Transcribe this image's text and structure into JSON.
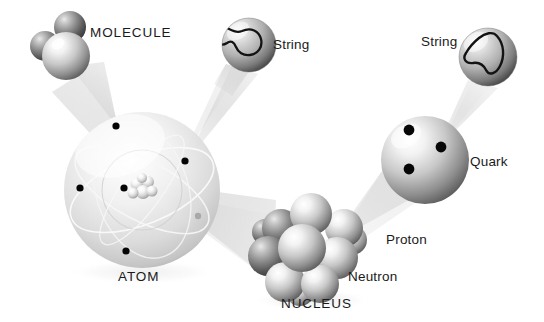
{
  "figure": {
    "background_color": "#ffffff",
    "width": 544,
    "height": 322
  },
  "labels": {
    "molecule": "MOLECULE",
    "string_1": "String",
    "string_2": "String",
    "quark": "Quark",
    "proton": "Proton",
    "neutron": "Neutron",
    "atom": "ATOM",
    "nucleus": "NUCLEUS"
  },
  "colors": {
    "text": "#1a1a1a",
    "sphere_light": "#ffffff",
    "sphere_mid": "#c9c9c9",
    "sphere_dark": "#4a4a4a",
    "sphere_edge": "#6e6e6e",
    "electron": "#050505",
    "cone": "#d8d8d8",
    "atom_shell": "#d0d0d0",
    "orbit_line": "#f2f2f2",
    "string_outline": "#111111"
  },
  "objects": {
    "molecule": {
      "name": "MOLECULE",
      "atom_count": 3,
      "atoms": [
        {
          "cx": 45,
          "cy": 46,
          "r": 15
        },
        {
          "cx": 70,
          "cy": 27,
          "r": 16
        },
        {
          "cx": 66,
          "cy": 56,
          "r": 24
        }
      ]
    },
    "atom": {
      "name": "ATOM",
      "cx": 142,
      "cy": 190,
      "r": 78,
      "electron_count": 6,
      "electrons": [
        {
          "cx": 116,
          "cy": 126
        },
        {
          "cx": 185,
          "cy": 161
        },
        {
          "cx": 80,
          "cy": 188
        },
        {
          "cx": 124,
          "cy": 188
        },
        {
          "cx": 198,
          "cy": 216
        },
        {
          "cx": 126,
          "cy": 251
        }
      ],
      "nucleus_center": {
        "cx": 143,
        "cy": 187,
        "r": 14
      }
    },
    "nucleus": {
      "name": "NUCLEUS",
      "cx": 310,
      "cy": 248,
      "nucleon_count": 11,
      "nucleons": [
        {
          "cx": 281,
          "cy": 228,
          "r": 19
        },
        {
          "cx": 311,
          "cy": 214,
          "r": 21
        },
        {
          "cx": 344,
          "cy": 228,
          "r": 19
        },
        {
          "cx": 268,
          "cy": 256,
          "r": 20
        },
        {
          "cx": 302,
          "cy": 248,
          "r": 24
        },
        {
          "cx": 337,
          "cy": 258,
          "r": 21
        },
        {
          "cx": 285,
          "cy": 282,
          "r": 20
        },
        {
          "cx": 320,
          "cy": 284,
          "r": 19
        },
        {
          "cx": 352,
          "cy": 240,
          "r": 15
        },
        {
          "cx": 265,
          "cy": 232,
          "r": 13
        },
        {
          "cx": 300,
          "cy": 292,
          "r": 14
        }
      ],
      "labels": {
        "proton": "Proton",
        "neutron": "Neutron"
      }
    },
    "proton": {
      "name": "Proton",
      "cx": 425,
      "cy": 160,
      "r": 44,
      "quark_count": 3,
      "quark_label": "Quark",
      "quarks": [
        {
          "cx": 409,
          "cy": 130
        },
        {
          "cx": 441,
          "cy": 147
        },
        {
          "cx": 409,
          "cy": 169
        }
      ]
    },
    "string_bubble_1": {
      "label": "String",
      "cx": 249,
      "cy": 45,
      "r": 27,
      "shape": "peanut-loop"
    },
    "string_bubble_2": {
      "label": "String",
      "cx": 488,
      "cy": 57,
      "r": 29,
      "shape": "tri-lobe-loop"
    }
  },
  "magnifier_cones": [
    {
      "from": "atom",
      "to": "molecule",
      "name": "cone-atom-to-molecule"
    },
    {
      "from": "atom_electron",
      "to": "string_bubble_1",
      "name": "cone-electron-to-string"
    },
    {
      "from": "atom_nucleus",
      "to": "nucleus",
      "name": "cone-nucleus"
    },
    {
      "from": "nucleus",
      "to": "proton",
      "name": "cone-proton"
    },
    {
      "from": "proton_quark",
      "to": "string_bubble_2",
      "name": "cone-quark-to-string"
    }
  ]
}
